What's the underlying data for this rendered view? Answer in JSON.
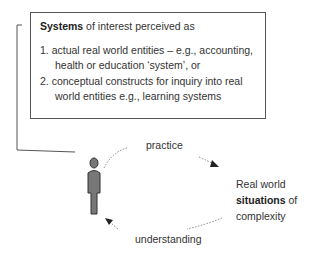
{
  "box": {
    "heading_bold": "Systems",
    "heading_rest": " of interest perceived as",
    "items": [
      {
        "line1": "1. actual real world entities – e.g., accounting,",
        "line2": "health or education ‘system’, or"
      },
      {
        "line1": "2. conceptual constructs for inquiry into real",
        "line2": "world entities e.g., learning systems"
      }
    ]
  },
  "cycle": {
    "top_label": "practice",
    "bottom_label": "understanding",
    "right_line1": "Real world",
    "right_bold": "situations",
    "right_of": " of",
    "right_line3": "complexity"
  },
  "icons": {
    "person": "person-icon"
  }
}
